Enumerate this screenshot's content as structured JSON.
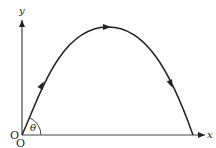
{
  "diagram": {
    "type": "projectile-trajectory",
    "axes": {
      "x_label": "x",
      "y_label": "y",
      "origin_labels": [
        "O",
        "O"
      ]
    },
    "angle_label": "θ",
    "trajectory": {
      "shape": "parabola",
      "direction_arrows": [
        "ascending",
        "apex",
        "descending"
      ]
    },
    "colors": {
      "stroke": "#222222",
      "axis": "#444444",
      "background": "#ffffff"
    }
  }
}
